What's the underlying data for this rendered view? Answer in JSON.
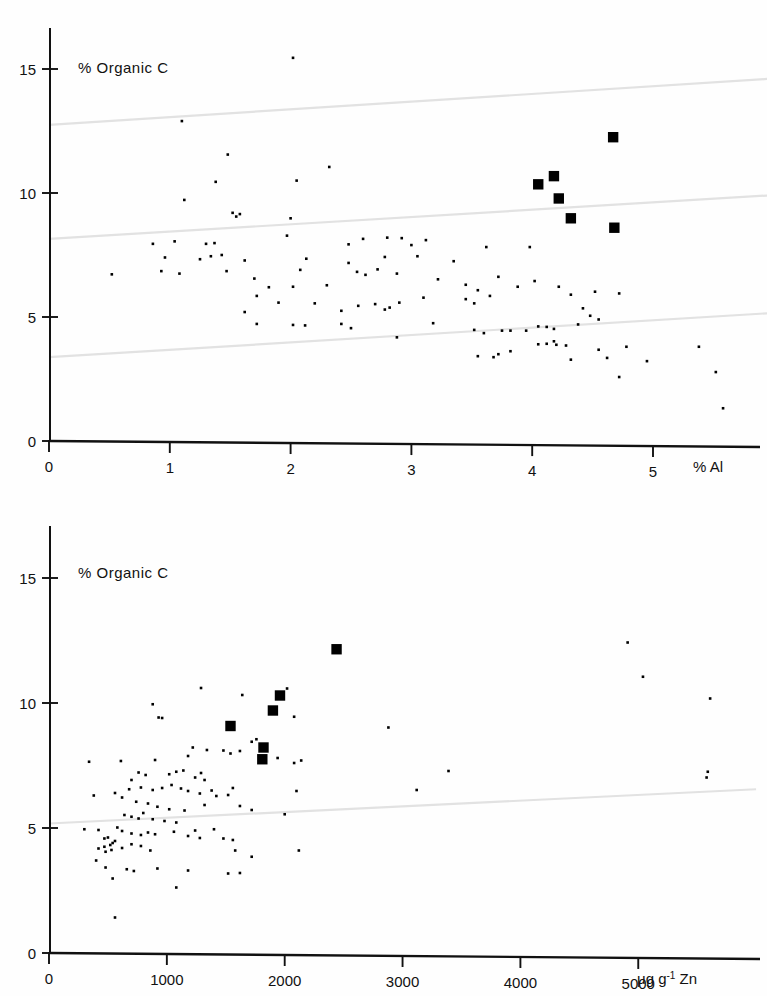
{
  "figure": {
    "background_color": "#fefefe",
    "ink_color": "#111111",
    "trend_line_color": "#e2e2e2",
    "marker_color": "#000000"
  },
  "panels": [
    {
      "id": "panel-al",
      "ylabel": "% Organic C",
      "x_unit_label": "% Al",
      "y_ticks": [
        "0",
        "5",
        "10",
        "15"
      ],
      "x_ticks": [
        "0",
        "1",
        "2",
        "3",
        "4",
        "5"
      ]
    },
    {
      "id": "panel-zn",
      "ylabel": "% Organic C",
      "x_unit_label_value": "5000",
      "x_unit_label_units": "μg g",
      "x_unit_label_exp": "-1",
      "x_unit_label_element": "Zn",
      "y_ticks": [
        "0",
        "5",
        "10",
        "15"
      ],
      "x_ticks": [
        "0",
        "1000",
        "2000",
        "3000",
        "4000",
        "5000"
      ]
    }
  ],
  "chart_data": [
    {
      "type": "scatter",
      "id": "organic-c-vs-al",
      "title": "% Organic C",
      "xlabel": "% Al",
      "ylabel": "% Organic C",
      "xlim": [
        0,
        5.95
      ],
      "ylim": [
        0,
        17
      ],
      "grid": false,
      "legend": "none",
      "series": [
        {
          "name": "samples",
          "marker": "small-dot",
          "points": [
            [
              2.02,
              15.45
            ],
            [
              1.1,
              12.9
            ],
            [
              0.52,
              6.72
            ],
            [
              1.48,
              11.55
            ],
            [
              1.55,
              9.05
            ],
            [
              1.58,
              9.15
            ],
            [
              1.52,
              9.2
            ],
            [
              1.12,
              9.72
            ],
            [
              1.38,
              10.45
            ],
            [
              2.05,
              10.5
            ],
            [
              2.32,
              11.05
            ],
            [
              1.3,
              7.95
            ],
            [
              1.04,
              8.05
            ],
            [
              1.37,
              7.98
            ],
            [
              2.0,
              8.98
            ],
            [
              2.8,
              8.2
            ],
            [
              2.92,
              8.18
            ],
            [
              2.6,
              8.15
            ],
            [
              3.12,
              8.1
            ],
            [
              3.0,
              7.9
            ],
            [
              2.48,
              7.93
            ],
            [
              1.97,
              8.28
            ],
            [
              0.86,
              7.95
            ],
            [
              1.34,
              7.45
            ],
            [
              1.43,
              7.5
            ],
            [
              1.62,
              7.28
            ],
            [
              1.47,
              6.85
            ],
            [
              1.25,
              7.33
            ],
            [
              0.96,
              7.4
            ],
            [
              0.93,
              6.85
            ],
            [
              1.7,
              6.55
            ],
            [
              2.08,
              6.9
            ],
            [
              2.13,
              7.35
            ],
            [
              2.48,
              7.18
            ],
            [
              2.55,
              6.82
            ],
            [
              2.72,
              6.92
            ],
            [
              2.78,
              7.42
            ],
            [
              2.62,
              6.7
            ],
            [
              2.88,
              6.75
            ],
            [
              3.05,
              7.45
            ],
            [
              3.22,
              6.52
            ],
            [
              3.35,
              7.25
            ],
            [
              3.45,
              6.3
            ],
            [
              3.62,
              7.82
            ],
            [
              3.55,
              6.08
            ],
            [
              3.72,
              6.62
            ],
            [
              3.88,
              6.22
            ],
            [
              3.52,
              5.55
            ],
            [
              3.45,
              5.72
            ],
            [
              3.65,
              5.85
            ],
            [
              2.42,
              5.25
            ],
            [
              2.56,
              5.45
            ],
            [
              2.7,
              5.52
            ],
            [
              2.78,
              5.3
            ],
            [
              2.82,
              5.38
            ],
            [
              2.9,
              5.58
            ],
            [
              3.1,
              5.78
            ],
            [
              2.2,
              5.55
            ],
            [
              1.62,
              5.2
            ],
            [
              1.72,
              4.72
            ],
            [
              2.02,
              4.68
            ],
            [
              2.12,
              4.66
            ],
            [
              2.5,
              4.55
            ],
            [
              2.42,
              4.72
            ],
            [
              2.88,
              4.18
            ],
            [
              3.18,
              4.75
            ],
            [
              3.52,
              4.48
            ],
            [
              3.6,
              4.35
            ],
            [
              3.75,
              4.45
            ],
            [
              3.82,
              4.45
            ],
            [
              3.95,
              4.45
            ],
            [
              4.05,
              4.62
            ],
            [
              4.12,
              4.6
            ],
            [
              4.18,
              4.52
            ],
            [
              3.55,
              3.42
            ],
            [
              3.68,
              3.38
            ],
            [
              3.72,
              3.5
            ],
            [
              3.82,
              3.62
            ],
            [
              4.05,
              3.9
            ],
            [
              4.12,
              3.92
            ],
            [
              4.2,
              3.88
            ],
            [
              4.28,
              3.85
            ],
            [
              4.18,
              4.02
            ],
            [
              4.38,
              4.7
            ],
            [
              4.48,
              5.05
            ],
            [
              4.55,
              4.9
            ],
            [
              4.42,
              5.35
            ],
            [
              4.52,
              6.02
            ],
            [
              4.72,
              5.95
            ],
            [
              4.32,
              3.28
            ],
            [
              4.55,
              3.68
            ],
            [
              4.62,
              3.35
            ],
            [
              4.78,
              3.8
            ],
            [
              4.72,
              2.58
            ],
            [
              4.95,
              3.22
            ],
            [
              5.38,
              3.8
            ],
            [
              5.52,
              2.78
            ],
            [
              5.58,
              1.32
            ],
            [
              4.02,
              6.45
            ],
            [
              4.22,
              6.22
            ],
            [
              4.32,
              5.9
            ],
            [
              3.98,
              7.82
            ],
            [
              2.3,
              6.28
            ],
            [
              2.02,
              6.22
            ],
            [
              1.82,
              6.2
            ],
            [
              1.9,
              5.58
            ],
            [
              1.72,
              5.85
            ],
            [
              1.08,
              6.75
            ]
          ]
        },
        {
          "name": "highlighted",
          "marker": "filled-square",
          "points": [
            [
              4.67,
              12.25
            ],
            [
              4.18,
              10.68
            ],
            [
              4.05,
              10.35
            ],
            [
              4.22,
              9.78
            ],
            [
              4.32,
              8.98
            ],
            [
              4.68,
              8.6
            ]
          ]
        }
      ],
      "trend_lines": [
        {
          "x0": 0,
          "y0": 12.75,
          "x1": 5.95,
          "y1": 14.6
        },
        {
          "x0": 0,
          "y0": 8.15,
          "x1": 5.95,
          "y1": 9.9
        },
        {
          "x0": 0,
          "y0": 3.38,
          "x1": 5.95,
          "y1": 5.15
        }
      ]
    },
    {
      "type": "scatter",
      "id": "organic-c-vs-zn",
      "title": "% Organic C",
      "xlabel": "μg g⁻¹ Zn",
      "ylabel": "% Organic C",
      "xlim": [
        0,
        6000
      ],
      "ylim": [
        0,
        17
      ],
      "grid": false,
      "legend": "none",
      "series": [
        {
          "name": "samples",
          "marker": "small-dot",
          "points": [
            [
              1290,
              10.6
            ],
            [
              880,
              9.95
            ],
            [
              930,
              9.42
            ],
            [
              960,
              9.4
            ],
            [
              1540,
              9.08
            ],
            [
              1640,
              10.32
            ],
            [
              1760,
              8.55
            ],
            [
              2020,
              10.58
            ],
            [
              2080,
              9.45
            ],
            [
              2880,
              9.02
            ],
            [
              4910,
              12.42
            ],
            [
              5040,
              11.05
            ],
            [
              5610,
              10.18
            ],
            [
              2140,
              7.7
            ],
            [
              1940,
              7.8
            ],
            [
              2080,
              7.6
            ],
            [
              3390,
              7.28
            ],
            [
              5580,
              7.02
            ],
            [
              5590,
              7.25
            ],
            [
              3120,
              6.52
            ],
            [
              2100,
              6.48
            ],
            [
              1220,
              8.22
            ],
            [
              1340,
              8.12
            ],
            [
              1180,
              7.88
            ],
            [
              900,
              7.72
            ],
            [
              610,
              7.68
            ],
            [
              1540,
              7.98
            ],
            [
              1480,
              8.1
            ],
            [
              1620,
              8.08
            ],
            [
              1720,
              8.45
            ],
            [
              760,
              7.22
            ],
            [
              820,
              7.12
            ],
            [
              1020,
              7.15
            ],
            [
              1080,
              7.25
            ],
            [
              1140,
              7.3
            ],
            [
              1240,
              7.02
            ],
            [
              1290,
              7.2
            ],
            [
              1320,
              6.92
            ],
            [
              700,
              6.92
            ],
            [
              680,
              6.55
            ],
            [
              780,
              6.62
            ],
            [
              880,
              6.52
            ],
            [
              960,
              6.6
            ],
            [
              1040,
              6.72
            ],
            [
              1120,
              6.58
            ],
            [
              1180,
              6.48
            ],
            [
              1280,
              6.38
            ],
            [
              1380,
              6.5
            ],
            [
              1420,
              6.28
            ],
            [
              1520,
              6.32
            ],
            [
              1560,
              6.6
            ],
            [
              560,
              6.4
            ],
            [
              620,
              6.22
            ],
            [
              740,
              6.05
            ],
            [
              840,
              5.98
            ],
            [
              920,
              5.85
            ],
            [
              1020,
              5.75
            ],
            [
              1150,
              5.7
            ],
            [
              1320,
              5.92
            ],
            [
              1620,
              5.88
            ],
            [
              1720,
              5.72
            ],
            [
              2000,
              5.55
            ],
            [
              640,
              5.52
            ],
            [
              700,
              5.45
            ],
            [
              760,
              5.38
            ],
            [
              800,
              5.6
            ],
            [
              880,
              5.35
            ],
            [
              980,
              5.28
            ],
            [
              1080,
              5.22
            ],
            [
              1240,
              4.9
            ],
            [
              1400,
              4.95
            ],
            [
              580,
              5.02
            ],
            [
              620,
              4.88
            ],
            [
              700,
              4.78
            ],
            [
              780,
              4.72
            ],
            [
              840,
              4.82
            ],
            [
              900,
              4.75
            ],
            [
              1060,
              4.85
            ],
            [
              1180,
              4.68
            ],
            [
              1280,
              4.6
            ],
            [
              1480,
              4.58
            ],
            [
              1560,
              4.52
            ],
            [
              420,
              4.92
            ],
            [
              470,
              4.58
            ],
            [
              500,
              4.62
            ],
            [
              540,
              4.4
            ],
            [
              470,
              4.25
            ],
            [
              520,
              4.32
            ],
            [
              560,
              4.48
            ],
            [
              420,
              4.18
            ],
            [
              480,
              4.05
            ],
            [
              530,
              4.12
            ],
            [
              620,
              4.2
            ],
            [
              700,
              4.35
            ],
            [
              780,
              4.28
            ],
            [
              860,
              4.1
            ],
            [
              1580,
              4.1
            ],
            [
              1720,
              3.85
            ],
            [
              2120,
              4.1
            ],
            [
              400,
              3.7
            ],
            [
              480,
              3.42
            ],
            [
              660,
              3.35
            ],
            [
              720,
              3.28
            ],
            [
              920,
              3.38
            ],
            [
              1180,
              3.3
            ],
            [
              1520,
              3.18
            ],
            [
              1620,
              3.2
            ],
            [
              540,
              2.98
            ],
            [
              1080,
              2.62
            ],
            [
              560,
              1.42
            ],
            [
              380,
              6.3
            ],
            [
              340,
              7.65
            ],
            [
              300,
              4.95
            ]
          ]
        },
        {
          "name": "highlighted",
          "marker": "filled-square",
          "points": [
            [
              2440,
              12.15
            ],
            [
              1960,
              10.3
            ],
            [
              1900,
              9.7
            ],
            [
              1540,
              9.08
            ],
            [
              1820,
              8.22
            ],
            [
              1810,
              7.75
            ]
          ]
        }
      ],
      "trend_lines": [
        {
          "x0": 0,
          "y0": 5.18,
          "x1": 6000,
          "y1": 6.55
        }
      ]
    }
  ]
}
